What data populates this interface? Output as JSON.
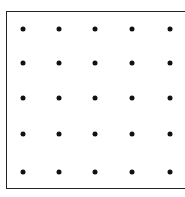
{
  "diagram": {
    "type": "dot-grid",
    "rows": 5,
    "cols": 5,
    "dot_color": "#111111",
    "border_color": "#222222",
    "col_x": [
      23,
      59,
      95,
      132,
      170
    ],
    "row_y": [
      29,
      63,
      98,
      134,
      172
    ]
  }
}
